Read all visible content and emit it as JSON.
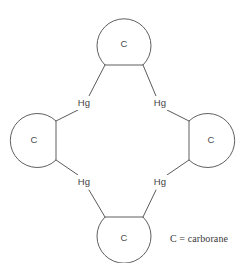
{
  "figure": {
    "type": "chemical-structure-diagram",
    "background_color": "#ffffff",
    "line_color": "#5a5a5a",
    "text_color": "#3f3f3f"
  },
  "cages": [
    {
      "id": "top",
      "label": "C",
      "cx": 124,
      "cy": 44,
      "r": 27,
      "chord": "bottom"
    },
    {
      "id": "left",
      "label": "C",
      "cx": 36,
      "cy": 140,
      "r": 27,
      "chord": "right"
    },
    {
      "id": "right",
      "label": "C",
      "cx": 209,
      "cy": 140,
      "r": 27,
      "chord": "left"
    },
    {
      "id": "bottom",
      "label": "C",
      "cx": 124,
      "cy": 238,
      "r": 27,
      "chord": "top"
    }
  ],
  "metals": [
    {
      "id": "top-left",
      "label": "Hg",
      "x": 84,
      "y": 103
    },
    {
      "id": "top-right",
      "label": "Hg",
      "x": 160,
      "y": 103
    },
    {
      "id": "bottom-left",
      "label": "Hg",
      "x": 84,
      "y": 182
    },
    {
      "id": "bottom-right",
      "label": "Hg",
      "x": 160,
      "y": 182
    }
  ],
  "legend": {
    "text": "C = carborane"
  }
}
